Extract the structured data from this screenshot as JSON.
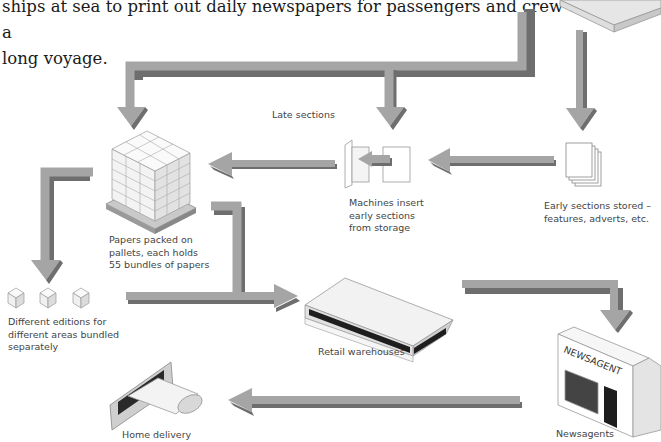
{
  "intro": {
    "lines": [
      "ships at sea to print out daily newspapers for passengers and crew on a",
      "long voyage."
    ]
  },
  "nodes": {
    "late_sections": {
      "label": "Late sections"
    },
    "pallets": {
      "label": "Papers packed on\npallets, each holds\n55 bundles of papers"
    },
    "machines": {
      "label": "Machines insert\nearly sections\nfrom storage"
    },
    "early_sections": {
      "label": "Early sections stored –\nfeatures, adverts, etc."
    },
    "editions": {
      "label": "Different editions for\ndifferent areas bundled\nseparately"
    },
    "warehouses": {
      "label": "Retail warehouses"
    },
    "newsagents": {
      "label": "Newsagents",
      "sign": "NEWSAGENT"
    },
    "home_delivery": {
      "label": "Home delivery"
    }
  },
  "colors": {
    "arrow_fill": "#a3a3a3",
    "arrow_shadow": "#6e6e6e",
    "outline": "#9a9a9a",
    "dark": "#2a2a2a"
  }
}
